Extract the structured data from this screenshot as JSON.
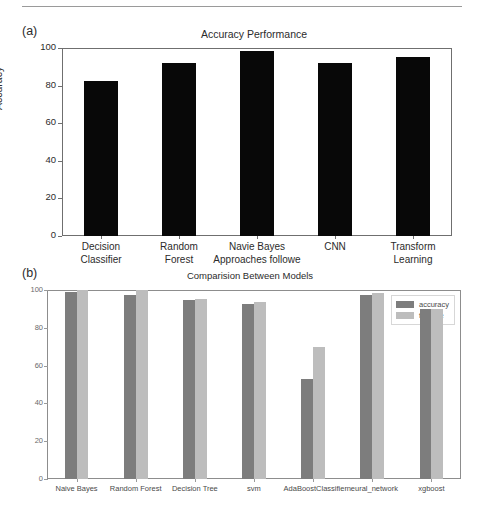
{
  "figure": {
    "panel_a_tag": "(a)",
    "panel_b_tag": "(b)"
  },
  "chart_data": [
    {
      "type": "bar",
      "panel": "(a)",
      "title": "Accuracy Performance",
      "xlabel": "",
      "ylabel": "Accuracy",
      "ylim": [
        0,
        100
      ],
      "yticks": [
        0,
        20,
        40,
        60,
        80,
        100
      ],
      "ytick_labels": [
        "0",
        "20",
        "40",
        "60",
        "80",
        "100"
      ],
      "grid": false,
      "legend": null,
      "bar_color": "#080808",
      "categories": [
        "Decision\nClassifier",
        "Random\nForest",
        "Navie Bayes\nApproaches followe",
        "CNN",
        "Transform\nLearning"
      ],
      "category_lines": [
        [
          "Decision",
          "Classifier"
        ],
        [
          "Random",
          "Forest"
        ],
        [
          "Navie Bayes",
          "Approaches followe"
        ],
        [
          "CNN",
          ""
        ],
        [
          "Transform",
          "Learning"
        ]
      ],
      "values": [
        82.5,
        92,
        98.5,
        92,
        95
      ]
    },
    {
      "type": "bar",
      "panel": "(b)",
      "title": "Comparision Between Models",
      "xlabel": "",
      "ylabel": "",
      "ylim": [
        0,
        100
      ],
      "yticks": [
        0,
        20,
        40,
        60,
        80,
        100
      ],
      "ytick_labels": [
        "0",
        "20",
        "40",
        "60",
        "80",
        "100"
      ],
      "grid": false,
      "legend_position": "upper right",
      "categories": [
        "Naive Bayes",
        "Random Forest",
        "Decision Tree",
        "svm",
        "AdaBoostClassifier",
        "neural_network",
        "xgboost"
      ],
      "series": [
        {
          "name": "accuracy",
          "color": "#7d7d7d",
          "values": [
            98.7,
            97.6,
            94.7,
            92.8,
            52.7,
            97.6,
            90.2
          ]
        },
        {
          "name": "f1score",
          "color": "#bdbdbd",
          "values": [
            99.8,
            99.8,
            95.5,
            93.8,
            69.8,
            98.5,
            90.2
          ]
        }
      ]
    }
  ]
}
